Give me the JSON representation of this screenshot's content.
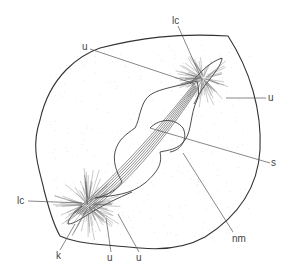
{
  "figure": {
    "type": "scientific line drawing",
    "labels": [
      {
        "id": "lc-top",
        "text": "lc"
      },
      {
        "id": "u-upper-left",
        "text": "u"
      },
      {
        "id": "u-right",
        "text": "u"
      },
      {
        "id": "s",
        "text": "s"
      },
      {
        "id": "nm",
        "text": "nm"
      },
      {
        "id": "lc-left",
        "text": "lc"
      },
      {
        "id": "k",
        "text": "k"
      },
      {
        "id": "u-bottom-1",
        "text": "u"
      },
      {
        "id": "u-bottom-2",
        "text": "u"
      }
    ]
  }
}
